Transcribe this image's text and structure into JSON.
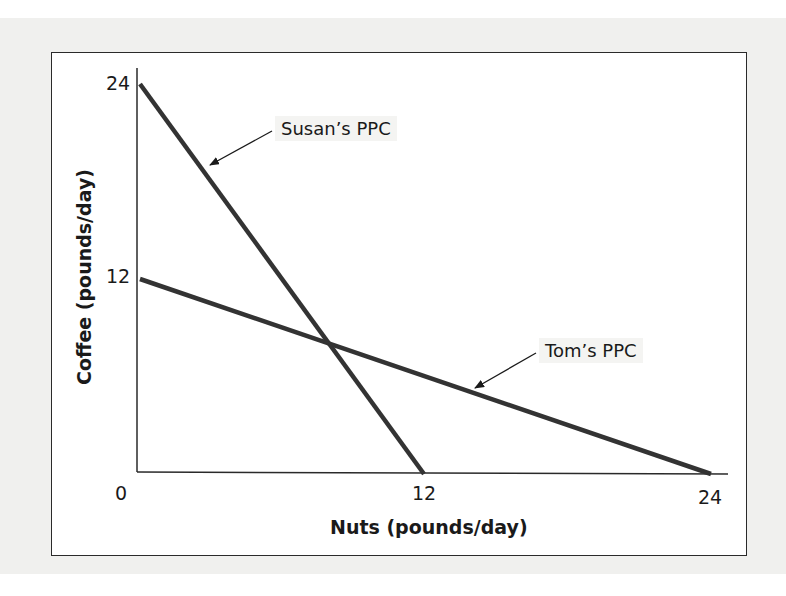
{
  "chart_data": {
    "type": "line",
    "title": "",
    "xlabel": "Nuts (pounds/day)",
    "ylabel": "Coffee (pounds/day)",
    "xlim": [
      0,
      24
    ],
    "ylim": [
      0,
      24
    ],
    "x_ticks": [
      "0",
      "12",
      "24"
    ],
    "y_ticks": [
      "12",
      "24"
    ],
    "grid": false,
    "legend": "none (inline arrow annotations)",
    "series": [
      {
        "name": "Susan's PPC",
        "x": [
          0,
          12
        ],
        "y": [
          24,
          0
        ],
        "color": "#333333"
      },
      {
        "name": "Tom's PPC",
        "x": [
          0,
          24
        ],
        "y": [
          12,
          0
        ],
        "color": "#333333"
      }
    ],
    "annotations": [
      {
        "text": "Susan's PPC",
        "points_to": "Susan's PPC line",
        "at_x": 2.5,
        "at_y": 19
      },
      {
        "text": "Tom's PPC",
        "points_to": "Tom's PPC line",
        "at_x": 14,
        "at_y": 5
      }
    ],
    "intersection": {
      "x": 8,
      "y": 8
    }
  },
  "labels": {
    "origin": "0",
    "x_tick_12": "12",
    "x_tick_24": "24",
    "y_tick_12": "12",
    "y_tick_24": "24",
    "xlabel": "Nuts (pounds/day)",
    "ylabel": "Coffee (pounds/day)",
    "susan": "Susan’s PPC",
    "tom": "Tom’s PPC"
  },
  "colors": {
    "line": "#333333",
    "axis": "#2a2a2a",
    "page_background": "#f0f0ee",
    "plot_background": "#ffffff"
  }
}
